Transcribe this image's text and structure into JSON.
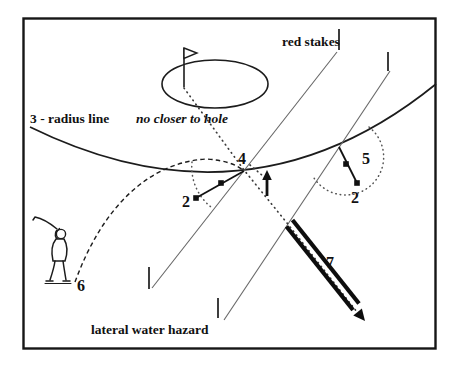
{
  "diagram": {
    "texts": {
      "radius_line_bold": "3 - radius line",
      "radius_line_italic": "no closer to hole",
      "red_stakes": "red stakes",
      "lateral_water_hazard": "lateral water hazard"
    },
    "markers": {
      "point_4": "4",
      "point_5": "5",
      "drop_left_2": "2",
      "drop_right_2": "2",
      "golfer_6": "6",
      "arrow_7": "7"
    },
    "colors": {
      "ink": "#111111",
      "hazard_line_gray": "#666666",
      "dotted_gray": "#555555",
      "background": "#ffffff"
    }
  }
}
